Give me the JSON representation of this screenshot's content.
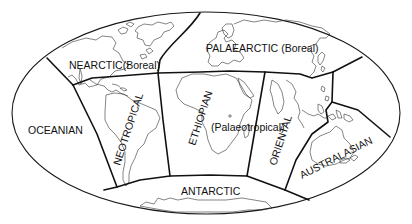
{
  "map": {
    "title": "Zoogeographic realms of the world",
    "projection": "elliptical world outline",
    "colors": {
      "background": "#ffffff",
      "lines": "#111111"
    },
    "realms": [
      {
        "id": "nearctic",
        "name": "NEARCTIC",
        "qualifier": "(Boreal)"
      },
      {
        "id": "palaearctic",
        "name": "PALAEARCTIC",
        "qualifier": "(Boreal)"
      },
      {
        "id": "neotropical",
        "name": "NEOTROPICAL",
        "qualifier": ""
      },
      {
        "id": "ethiopian",
        "name": "ETHIOPIAN",
        "qualifier": "(Palaeotropical)"
      },
      {
        "id": "oriental",
        "name": "ORIENTAL",
        "qualifier": ""
      },
      {
        "id": "australasian",
        "name": "AUSTRALASIAN",
        "qualifier": ""
      },
      {
        "id": "oceanian",
        "name": "OCEANIAN",
        "qualifier": ""
      },
      {
        "id": "antarctic",
        "name": "ANTARCTIC",
        "qualifier": ""
      }
    ]
  }
}
